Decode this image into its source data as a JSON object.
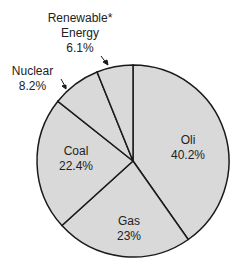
{
  "chart_data": {
    "type": "pie",
    "title": "",
    "start_angle_deg": 0,
    "direction": "clockwise",
    "fill_color": "#d9d9d9",
    "stroke_color": "#1a1a1a",
    "slices": [
      {
        "label": "Oli",
        "value": 40.2,
        "display": "40.2%"
      },
      {
        "label": "Gas",
        "value": 23,
        "display": "23%"
      },
      {
        "label": "Coal",
        "value": 22.4,
        "display": "22.4%"
      },
      {
        "label": "Nuclear",
        "value": 8.2,
        "display": "8.2%"
      },
      {
        "label": "Renewable* Energy",
        "value": 6.1,
        "display": "6.1%"
      }
    ]
  },
  "labels": {
    "oil": {
      "name": "Oli",
      "pct": "40.2%"
    },
    "gas": {
      "name": "Gas",
      "pct": "23%"
    },
    "coal": {
      "name": "Coal",
      "pct": "22.4%"
    },
    "nuclear": {
      "name": "Nuclear",
      "pct": "8.2%"
    },
    "renewable": {
      "name1": "Renewable*",
      "name2": "Energy",
      "pct": "6.1%"
    }
  }
}
